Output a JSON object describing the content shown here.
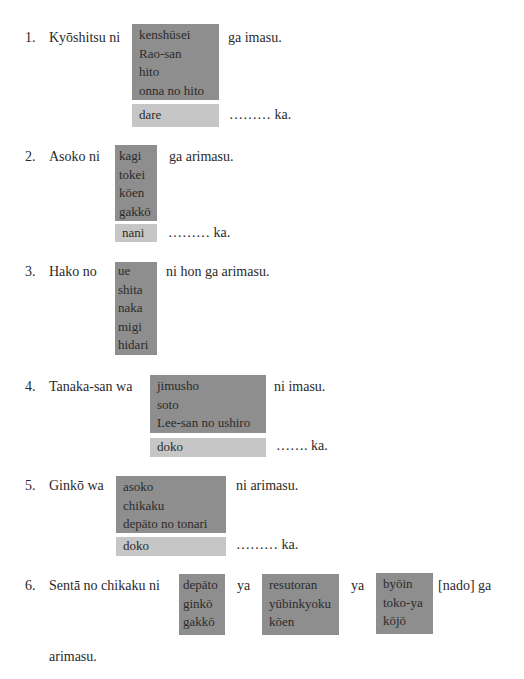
{
  "exercises": [
    {
      "number": "1.",
      "lead": "Kyōshitsu ni",
      "options": [
        "kenshūsei",
        "Rao-san",
        "hito",
        "onna no hito"
      ],
      "tail": "ga imasu.",
      "question_word": "dare",
      "question_tail": "……… ka."
    },
    {
      "number": "2.",
      "lead": "Asoko ni",
      "options": [
        "kagi",
        "tokei",
        "kōen",
        "gakkō"
      ],
      "tail": "ga arimasu.",
      "question_word": "nani",
      "question_tail": "……… ka."
    },
    {
      "number": "3.",
      "lead": "Hako no",
      "options": [
        "ue",
        "shita",
        "naka",
        "migi",
        "hidari"
      ],
      "tail": "ni hon ga arimasu."
    },
    {
      "number": "4.",
      "lead": "Tanaka-san wa",
      "options": [
        "jimusho",
        "soto",
        "Lee-san no ushiro"
      ],
      "tail": "ni imasu.",
      "question_word": "doko",
      "question_tail": "……. ka."
    },
    {
      "number": "5.",
      "lead": "Ginkō wa",
      "options": [
        "asoko",
        "chikaku",
        "depāto no tonari"
      ],
      "tail": "ni arimasu.",
      "question_word": "doko",
      "question_tail": "……… ka."
    },
    {
      "number": "6.",
      "lead": "Sentā no chikaku ni",
      "groups": [
        [
          "depāto",
          "ginkō",
          "gakkō"
        ],
        [
          "resutoran",
          "yūbinkyoku",
          "kōen"
        ],
        [
          "byōin",
          "toko-ya",
          "kōjō"
        ]
      ],
      "connector": "ya",
      "tail": "[nado] ga",
      "continuation": "arimasu."
    }
  ],
  "colors": {
    "dark_box": "#8e8e8e",
    "light_box": "#c6c6c6",
    "text": "#2a2a2a"
  }
}
